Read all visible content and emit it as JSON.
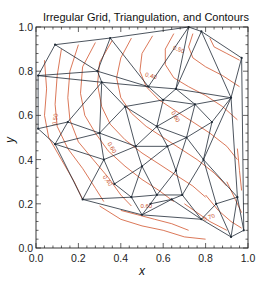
{
  "chart_data": {
    "type": "contour",
    "title": "Irregular Grid, Triangulation, and Contours",
    "xlabel": "x",
    "ylabel": "y",
    "xlim": [
      0.0,
      1.0
    ],
    "ylim": [
      0.0,
      1.0
    ],
    "xticks": [
      "0.0",
      "0.2",
      "0.4",
      "0.6",
      "0.8",
      "1.0"
    ],
    "yticks": [
      "0.0",
      "0.2",
      "0.4",
      "0.6",
      "0.8",
      "1.0"
    ],
    "x_tick_values": [
      0.0,
      0.2,
      0.4,
      0.6,
      0.8,
      1.0
    ],
    "y_tick_values": [
      0.0,
      0.2,
      0.4,
      0.6,
      0.8,
      1.0
    ],
    "minor_ticks_per_major": 4,
    "grid": false,
    "legend": null,
    "triangulation_color": "#1f2a36",
    "contour_color": "#d2552e",
    "nodes": [
      [
        0.09,
        0.92
      ],
      [
        0.35,
        0.95
      ],
      [
        0.72,
        1.0
      ],
      [
        0.78,
        0.98
      ],
      [
        0.97,
        0.86
      ],
      [
        0.01,
        0.78
      ],
      [
        0.29,
        0.8
      ],
      [
        0.31,
        0.75
      ],
      [
        0.66,
        0.72
      ],
      [
        0.92,
        0.68
      ],
      [
        0.42,
        0.64
      ],
      [
        0.53,
        0.73
      ],
      [
        0.6,
        0.67
      ],
      [
        0.75,
        0.65
      ],
      [
        0.83,
        0.57
      ],
      [
        0.01,
        0.54
      ],
      [
        0.15,
        0.57
      ],
      [
        0.3,
        0.52
      ],
      [
        0.47,
        0.46
      ],
      [
        0.57,
        0.55
      ],
      [
        0.71,
        0.5
      ],
      [
        0.62,
        0.46
      ],
      [
        0.09,
        0.47
      ],
      [
        0.32,
        0.4
      ],
      [
        0.5,
        0.37
      ],
      [
        0.66,
        0.35
      ],
      [
        0.79,
        0.4
      ],
      [
        0.95,
        0.23
      ],
      [
        0.37,
        0.29
      ],
      [
        0.57,
        0.24
      ],
      [
        0.69,
        0.24
      ],
      [
        0.45,
        0.23
      ],
      [
        0.85,
        0.2
      ],
      [
        0.78,
        0.13
      ],
      [
        0.92,
        0.05
      ],
      [
        0.22,
        0.22
      ],
      [
        0.54,
        0.2
      ],
      [
        0.64,
        0.22
      ],
      [
        0.98,
        0.08
      ],
      [
        0.5,
        0.15
      ]
    ],
    "edges": [
      [
        0,
        1
      ],
      [
        1,
        2
      ],
      [
        2,
        3
      ],
      [
        3,
        4
      ],
      [
        0,
        5
      ],
      [
        0,
        6
      ],
      [
        1,
        6
      ],
      [
        1,
        11
      ],
      [
        2,
        11
      ],
      [
        3,
        8
      ],
      [
        2,
        8
      ],
      [
        3,
        9
      ],
      [
        4,
        9
      ],
      [
        5,
        6
      ],
      [
        5,
        7
      ],
      [
        5,
        15
      ],
      [
        6,
        7
      ],
      [
        7,
        10
      ],
      [
        7,
        11
      ],
      [
        6,
        11
      ],
      [
        11,
        12
      ],
      [
        11,
        8
      ],
      [
        8,
        12
      ],
      [
        8,
        13
      ],
      [
        8,
        9
      ],
      [
        9,
        13
      ],
      [
        9,
        14
      ],
      [
        13,
        14
      ],
      [
        7,
        16
      ],
      [
        15,
        16
      ],
      [
        16,
        17
      ],
      [
        7,
        17
      ],
      [
        10,
        17
      ],
      [
        10,
        18
      ],
      [
        10,
        19
      ],
      [
        10,
        12
      ],
      [
        12,
        19
      ],
      [
        12,
        13
      ],
      [
        13,
        19
      ],
      [
        13,
        20
      ],
      [
        14,
        20
      ],
      [
        19,
        20
      ],
      [
        19,
        21
      ],
      [
        18,
        19
      ],
      [
        18,
        21
      ],
      [
        20,
        21
      ],
      [
        15,
        22
      ],
      [
        16,
        22
      ],
      [
        22,
        23
      ],
      [
        17,
        22
      ],
      [
        17,
        23
      ],
      [
        17,
        18
      ],
      [
        18,
        23
      ],
      [
        18,
        24
      ],
      [
        21,
        24
      ],
      [
        21,
        25
      ],
      [
        20,
        25
      ],
      [
        20,
        26
      ],
      [
        14,
        26
      ],
      [
        9,
        26
      ],
      [
        9,
        27
      ],
      [
        26,
        27
      ],
      [
        22,
        35
      ],
      [
        23,
        35
      ],
      [
        23,
        28
      ],
      [
        24,
        28
      ],
      [
        28,
        31
      ],
      [
        24,
        31
      ],
      [
        24,
        29
      ],
      [
        25,
        29
      ],
      [
        25,
        30
      ],
      [
        26,
        30
      ],
      [
        26,
        32
      ],
      [
        27,
        32
      ],
      [
        29,
        30
      ],
      [
        29,
        36
      ],
      [
        30,
        37
      ],
      [
        36,
        37
      ],
      [
        35,
        31
      ],
      [
        31,
        39
      ],
      [
        36,
        39
      ],
      [
        29,
        31
      ],
      [
        30,
        33
      ],
      [
        32,
        33
      ],
      [
        27,
        34
      ],
      [
        32,
        34
      ],
      [
        33,
        34
      ],
      [
        33,
        37
      ],
      [
        37,
        39
      ],
      [
        35,
        39
      ],
      [
        34,
        38
      ],
      [
        27,
        38
      ],
      [
        33,
        39
      ],
      [
        4,
        38
      ]
    ],
    "contours": [
      {
        "level": 0.4,
        "points": [
          [
            0.04,
            0.85
          ],
          [
            0.05,
            0.72
          ],
          [
            0.04,
            0.6
          ],
          [
            0.06,
            0.5
          ],
          [
            0.12,
            0.4
          ],
          [
            0.18,
            0.3
          ],
          [
            0.22,
            0.22
          ]
        ]
      },
      {
        "level": 0.45,
        "points": [
          [
            0.12,
            0.9
          ],
          [
            0.1,
            0.78
          ],
          [
            0.09,
            0.65
          ],
          [
            0.1,
            0.55
          ],
          [
            0.15,
            0.45
          ],
          [
            0.22,
            0.36
          ],
          [
            0.28,
            0.27
          ],
          [
            0.32,
            0.21
          ]
        ]
      },
      {
        "level": 0.5,
        "points": [
          [
            0.2,
            0.92
          ],
          [
            0.16,
            0.8
          ],
          [
            0.15,
            0.68
          ],
          [
            0.16,
            0.58
          ],
          [
            0.2,
            0.48
          ],
          [
            0.27,
            0.4
          ],
          [
            0.34,
            0.32
          ],
          [
            0.4,
            0.24
          ],
          [
            0.45,
            0.19
          ]
        ]
      },
      {
        "level": 0.55,
        "points": [
          [
            0.28,
            0.93
          ],
          [
            0.22,
            0.82
          ],
          [
            0.21,
            0.7
          ],
          [
            0.23,
            0.6
          ],
          [
            0.28,
            0.52
          ],
          [
            0.34,
            0.44
          ],
          [
            0.42,
            0.37
          ],
          [
            0.5,
            0.31
          ],
          [
            0.58,
            0.26
          ],
          [
            0.65,
            0.21
          ]
        ]
      },
      {
        "level": 0.6,
        "points": [
          [
            0.36,
            0.94
          ],
          [
            0.3,
            0.84
          ],
          [
            0.29,
            0.74
          ],
          [
            0.31,
            0.64
          ],
          [
            0.35,
            0.56
          ],
          [
            0.42,
            0.49
          ],
          [
            0.5,
            0.43
          ],
          [
            0.58,
            0.38
          ],
          [
            0.66,
            0.33
          ],
          [
            0.74,
            0.28
          ],
          [
            0.8,
            0.23
          ]
        ]
      },
      {
        "level": 0.65,
        "points": [
          [
            0.45,
            0.95
          ],
          [
            0.4,
            0.86
          ],
          [
            0.38,
            0.77
          ],
          [
            0.4,
            0.68
          ],
          [
            0.45,
            0.61
          ],
          [
            0.52,
            0.55
          ],
          [
            0.6,
            0.5
          ],
          [
            0.68,
            0.45
          ],
          [
            0.76,
            0.4
          ],
          [
            0.84,
            0.34
          ],
          [
            0.9,
            0.28
          ]
        ]
      },
      {
        "level": 0.7,
        "points": [
          [
            0.55,
            0.96
          ],
          [
            0.5,
            0.88
          ],
          [
            0.49,
            0.8
          ],
          [
            0.52,
            0.73
          ],
          [
            0.58,
            0.67
          ],
          [
            0.66,
            0.62
          ],
          [
            0.74,
            0.57
          ],
          [
            0.82,
            0.52
          ],
          [
            0.9,
            0.46
          ],
          [
            0.95,
            0.4
          ]
        ]
      },
      {
        "level": 0.75,
        "points": [
          [
            0.65,
            0.97
          ],
          [
            0.61,
            0.9
          ],
          [
            0.61,
            0.83
          ],
          [
            0.65,
            0.77
          ],
          [
            0.72,
            0.73
          ],
          [
            0.8,
            0.69
          ],
          [
            0.88,
            0.64
          ],
          [
            0.95,
            0.58
          ]
        ]
      },
      {
        "level": 0.8,
        "points": [
          [
            0.74,
            0.97
          ],
          [
            0.72,
            0.91
          ],
          [
            0.74,
            0.86
          ],
          [
            0.8,
            0.82
          ],
          [
            0.88,
            0.78
          ],
          [
            0.96,
            0.73
          ]
        ]
      },
      {
        "level": 0.85,
        "points": [
          [
            0.82,
            0.95
          ],
          [
            0.84,
            0.91
          ],
          [
            0.9,
            0.88
          ],
          [
            0.96,
            0.85
          ]
        ]
      },
      {
        "level": 0.35,
        "points": [
          [
            0.7,
            0.2
          ],
          [
            0.76,
            0.16
          ],
          [
            0.82,
            0.12
          ],
          [
            0.9,
            0.08
          ]
        ]
      },
      {
        "level": 0.3,
        "points": [
          [
            0.8,
            0.24
          ],
          [
            0.86,
            0.17
          ],
          [
            0.92,
            0.12
          ],
          [
            0.97,
            0.09
          ]
        ]
      },
      {
        "level": 0.25,
        "points": [
          [
            0.9,
            0.3
          ],
          [
            0.94,
            0.22
          ],
          [
            0.97,
            0.16
          ]
        ]
      },
      {
        "level": 0.2,
        "points": [
          [
            0.95,
            0.45
          ],
          [
            0.96,
            0.35
          ],
          [
            0.97,
            0.26
          ]
        ]
      },
      {
        "level": 0.6,
        "points": [
          [
            0.4,
            0.17
          ],
          [
            0.48,
            0.15
          ],
          [
            0.56,
            0.13
          ],
          [
            0.64,
            0.11
          ],
          [
            0.72,
            0.08
          ]
        ]
      },
      {
        "level": 0.55,
        "points": [
          [
            0.3,
            0.19
          ],
          [
            0.4,
            0.13
          ],
          [
            0.5,
            0.1
          ],
          [
            0.6,
            0.08
          ],
          [
            0.7,
            0.05
          ],
          [
            0.8,
            0.04
          ]
        ]
      }
    ],
    "contour_labels": [
      {
        "text": "0.50",
        "x": 0.1,
        "y": 0.58,
        "angle": -80
      },
      {
        "text": "0.40",
        "x": 0.33,
        "y": 0.3,
        "angle": 55
      },
      {
        "text": "0.60",
        "x": 0.52,
        "y": 0.18,
        "angle": 0
      },
      {
        "text": "0.70",
        "x": 0.82,
        "y": 0.13,
        "angle": -20
      },
      {
        "text": "0.60",
        "x": 0.65,
        "y": 0.59,
        "angle": 60
      },
      {
        "text": "0.40",
        "x": 0.54,
        "y": 0.77,
        "angle": 15
      },
      {
        "text": "0.50",
        "x": 0.67,
        "y": 0.89,
        "angle": 20
      },
      {
        "text": "0.60",
        "x": 0.35,
        "y": 0.45,
        "angle": 60
      }
    ]
  }
}
